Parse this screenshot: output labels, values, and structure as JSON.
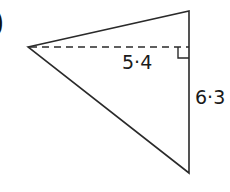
{
  "question_marker": ")",
  "diagram": {
    "type": "triangle",
    "vertices": {
      "left": [
        28,
        47
      ],
      "top_right": [
        189,
        11
      ],
      "bottom_right": [
        189,
        173
      ]
    },
    "height_line": {
      "style": "dashed",
      "from": [
        28,
        47
      ],
      "to": [
        189,
        47
      ],
      "label": "5·4"
    },
    "right_angle_marker": true,
    "side_label": {
      "side": "vertical right side",
      "value": "6·3"
    },
    "colors": {
      "stroke": "#2a2a2a",
      "text": "#1a1a1a",
      "background": "#ffffff"
    }
  },
  "labels": {
    "height": "5·4",
    "base": "6·3"
  }
}
